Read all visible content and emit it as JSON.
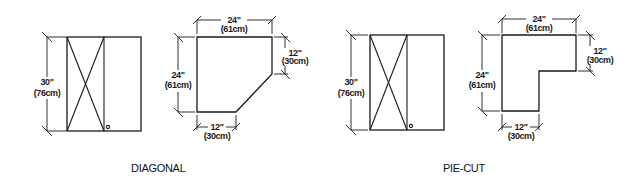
{
  "diagrams": [
    {
      "caption": "DIAGONAL",
      "cabinet": {
        "height_in": "30\"",
        "height_cm": "(76cm)"
      },
      "top": {
        "width_in": "24\"",
        "width_cm": "(61cm)",
        "depth_in": "24\"",
        "depth_cm": "(61cm)",
        "side_in": "12\"",
        "side_cm": "(30cm)",
        "bottom_in": "12\"",
        "bottom_cm": "(30cm)"
      }
    },
    {
      "caption": "PIE-CUT",
      "cabinet": {
        "height_in": "30\"",
        "height_cm": "(76cm)"
      },
      "top": {
        "width_in": "24\"",
        "width_cm": "(61cm)",
        "depth_in": "24\"",
        "depth_cm": "(61cm)",
        "side_in": "12\"",
        "side_cm": "(30cm)",
        "bottom_in": "12\"",
        "bottom_cm": "(30cm)"
      }
    }
  ],
  "colors": {
    "line": "#1a1a1a",
    "background": "#ffffff"
  }
}
